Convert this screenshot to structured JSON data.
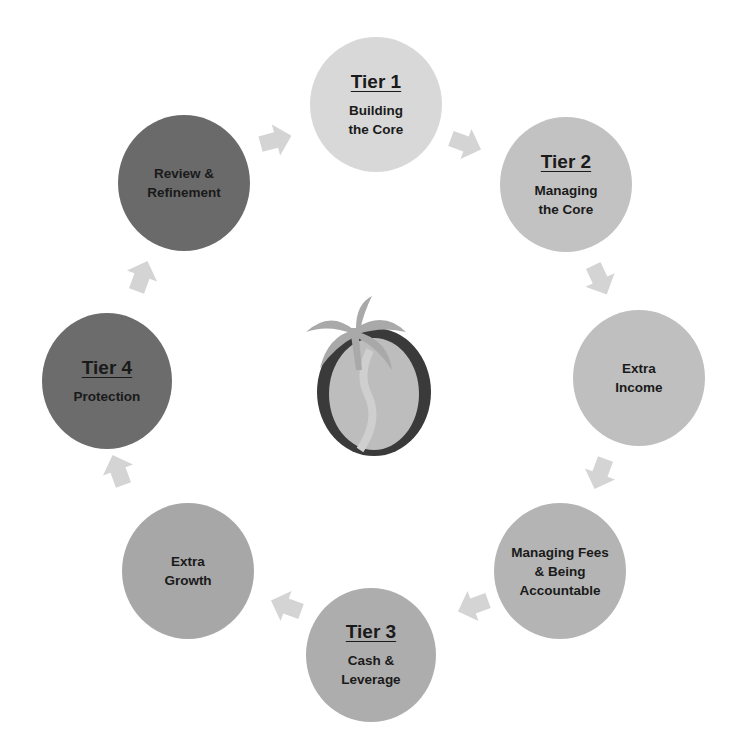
{
  "diagram": {
    "type": "cycle",
    "center_logo": "palm-tree-o-logo",
    "nodes": [
      {
        "id": "tier1",
        "tier": "Tier 1",
        "label": "Building\nthe Core",
        "color": "#d8d8d8",
        "x": 310,
        "y": 37,
        "w": 132,
        "h": 135
      },
      {
        "id": "tier2",
        "tier": "Tier 2",
        "label": "Managing\nthe Core",
        "color": "#c2c2c2",
        "x": 500,
        "y": 117,
        "w": 132,
        "h": 135
      },
      {
        "id": "extra-income",
        "tier": "",
        "label": "Extra\nIncome",
        "color": "#bfbfbf",
        "x": 573,
        "y": 310,
        "w": 132,
        "h": 136
      },
      {
        "id": "managing-fees",
        "tier": "",
        "label": "Managing Fees\n& Being\nAccountable",
        "color": "#b4b4b4",
        "x": 494,
        "y": 503,
        "w": 132,
        "h": 136
      },
      {
        "id": "tier3",
        "tier": "Tier 3",
        "label": "Cash &\nLeverage",
        "color": "#adadad",
        "x": 306,
        "y": 588,
        "w": 130,
        "h": 134
      },
      {
        "id": "extra-growth",
        "tier": "",
        "label": "Extra\nGrowth",
        "color": "#a7a7a7",
        "x": 122,
        "y": 503,
        "w": 132,
        "h": 136
      },
      {
        "id": "tier4",
        "tier": "Tier 4",
        "label": "Protection",
        "color": "#6c6c6c",
        "x": 42,
        "y": 313,
        "w": 130,
        "h": 136
      },
      {
        "id": "review",
        "tier": "",
        "label": "Review &\nRefinement",
        "color": "#6a6a6a",
        "x": 118,
        "y": 115,
        "w": 132,
        "h": 136
      }
    ],
    "arrows": [
      {
        "from": "review",
        "to": "tier1",
        "x": 258,
        "y": 122,
        "rot": -15
      },
      {
        "from": "tier1",
        "to": "tier2",
        "x": 448,
        "y": 126,
        "rot": 20
      },
      {
        "from": "tier2",
        "to": "extra-income",
        "x": 582,
        "y": 262,
        "rot": 65
      },
      {
        "from": "extra-income",
        "to": "managing-fees",
        "x": 582,
        "y": 456,
        "rot": 110
      },
      {
        "from": "managing-fees",
        "to": "tier3",
        "x": 455,
        "y": 588,
        "rot": 160
      },
      {
        "from": "tier3",
        "to": "extra-growth",
        "x": 268,
        "y": 588,
        "rot": 200
      },
      {
        "from": "extra-growth",
        "to": "tier4",
        "x": 100,
        "y": 452,
        "rot": 250
      },
      {
        "from": "tier4",
        "to": "review",
        "x": 124,
        "y": 258,
        "rot": 290
      }
    ],
    "colors": {
      "arrow": "#d4d4d4",
      "logo_ring": "#3a3a3a",
      "logo_fill": "#bdbdbd",
      "logo_palm": "#a9a9a9"
    }
  }
}
